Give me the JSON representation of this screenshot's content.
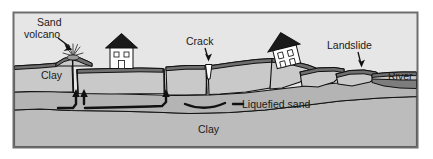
{
  "figure": {
    "type": "cross-section-diagram",
    "frame": {
      "border_color": "#6e6e6e",
      "background": "#e4e4e4"
    }
  },
  "labels": {
    "sand_volcano": "Sand\nvolcano",
    "sand_volcano_line1": "Sand",
    "sand_volcano_line2": "volcano",
    "clay_upper": "Clay",
    "crack": "Crack",
    "landslide": "Landslide",
    "river": "River",
    "liquefied_sand": "Liquefied sand",
    "clay_lower": "Clay"
  },
  "layers": [
    {
      "name": "sky",
      "label": "",
      "color": "#e6e6e6"
    },
    {
      "name": "topsoil-crust",
      "label": "",
      "color": "#6f6f6f"
    },
    {
      "name": "clay-upper",
      "label": "Clay",
      "color": "#c9c9c9"
    },
    {
      "name": "liquefied-sand",
      "label": "Liquefied sand",
      "color": "#b5b5b5"
    },
    {
      "name": "clay-lower",
      "label": "Clay",
      "color": "#bdbdbd"
    },
    {
      "name": "river-water",
      "label": "River",
      "color": "#7a7a7a"
    }
  ],
  "features": [
    {
      "name": "sand-volcano",
      "label": "Sand volcano"
    },
    {
      "name": "upright-house",
      "label": ""
    },
    {
      "name": "ground-crack",
      "label": "Crack"
    },
    {
      "name": "tilted-house",
      "label": ""
    },
    {
      "name": "landslide-block",
      "label": "Landslide"
    },
    {
      "name": "river",
      "label": "River"
    },
    {
      "name": "flow-arrows",
      "label": ""
    }
  ],
  "colors": {
    "outline": "#111111",
    "frame": "#6e6e6e",
    "sky": "#e6e6e6",
    "crust": "#6f6f6f",
    "clay_upper": "#c9c9c9",
    "liquefied": "#b4b4b4",
    "clay_lower": "#bcbcbc",
    "water": "#7d7d7d",
    "text": "#1a1a1a"
  }
}
